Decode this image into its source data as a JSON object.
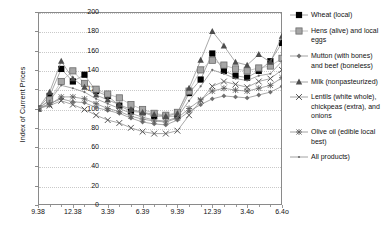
{
  "chart_data": {
    "type": "line",
    "title": "",
    "xlabel": "",
    "ylabel": "Index of Current Prices",
    "ylim": [
      0,
      200
    ],
    "ytick_values": [
      0,
      20,
      40,
      60,
      80,
      100,
      120,
      140,
      160,
      180,
      200
    ],
    "grid": true,
    "legend_position": "right",
    "x": [
      "9.38",
      "10.38",
      "11.38",
      "12.38",
      "1.39",
      "2.39",
      "3.39",
      "4.39",
      "5.39",
      "6.39",
      "7.39",
      "8.39",
      "9.39",
      "10.39",
      "11.39",
      "12.39",
      "1.40",
      "2.40",
      "3.40",
      "4.40",
      "5.40",
      "6.40"
    ],
    "xtick_labels": [
      "9.38",
      "12.38",
      "3.39",
      "6.39",
      "9.39",
      "12.39",
      "3.4o",
      "6.4o"
    ],
    "xtick_indices": [
      0,
      3,
      6,
      9,
      12,
      15,
      18,
      21
    ],
    "series": [
      {
        "name": "Wheat (local)",
        "marker": "filled-square",
        "color": "#000000",
        "values": [
          100,
          113,
          141,
          128,
          135,
          118,
          113,
          103,
          97,
          96,
          92,
          92,
          92,
          116,
          130,
          157,
          139,
          134,
          132,
          139,
          149,
          168
        ]
      },
      {
        "name": "Hens (alive) and local eggs",
        "marker": "gray-square",
        "color": "#9a9a9a",
        "values": [
          100,
          109,
          128,
          139,
          126,
          120,
          115,
          111,
          104,
          99,
          95,
          93,
          96,
          118,
          140,
          150,
          145,
          141,
          139,
          142,
          144,
          152
        ]
      },
      {
        "name": "Mutton (with bones) and beef (boneless)",
        "marker": "small-diamond",
        "color": "#6f6f6f",
        "values": [
          100,
          105,
          110,
          107,
          106,
          101,
          98,
          95,
          90,
          86,
          84,
          83,
          88,
          97,
          104,
          110,
          113,
          112,
          111,
          114,
          117,
          123
        ]
      },
      {
        "name": "Milk (nonpasteurized)",
        "marker": "triangle",
        "color": "#4d4d4d",
        "values": [
          100,
          117,
          149,
          131,
          122,
          114,
          109,
          104,
          99,
          96,
          94,
          92,
          95,
          121,
          150,
          180,
          165,
          148,
          145,
          156,
          148,
          175
        ]
      },
      {
        "name": "Lentils (white whole), chickpeas (extra), and onions",
        "marker": "x-cross",
        "color": "#555555",
        "values": [
          100,
          103,
          108,
          104,
          99,
          93,
          88,
          85,
          80,
          76,
          74,
          74,
          77,
          93,
          108,
          123,
          128,
          125,
          122,
          128,
          131,
          140
        ]
      },
      {
        "name": "Olive oil (edible local best)",
        "marker": "asterisk",
        "color": "#5a5a5a",
        "values": [
          100,
          104,
          112,
          112,
          110,
          105,
          100,
          97,
          92,
          89,
          87,
          86,
          90,
          100,
          109,
          118,
          121,
          119,
          118,
          121,
          124,
          132
        ]
      },
      {
        "name": "All products)",
        "marker": "tiny-dot",
        "color": "#6a6a6a",
        "values": [
          100,
          108,
          124,
          121,
          117,
          110,
          105,
          100,
          95,
          91,
          88,
          87,
          91,
          108,
          123,
          140,
          136,
          131,
          129,
          134,
          136,
          149
        ]
      }
    ]
  },
  "axis": {
    "y_title": "Index of Current Prices"
  },
  "legend": {
    "items": [
      {
        "label": "Wheat (local)"
      },
      {
        "label": "Hens (alive) and local eggs"
      },
      {
        "label": "Mutton (with bones) and beef (boneless)"
      },
      {
        "label": "Milk (nonpasteurized)"
      },
      {
        "label": "Lentils (white whole), chickpeas (extra), and onions"
      },
      {
        "label": "Olive oil (edible local best)"
      },
      {
        "label": "All products)"
      }
    ]
  }
}
